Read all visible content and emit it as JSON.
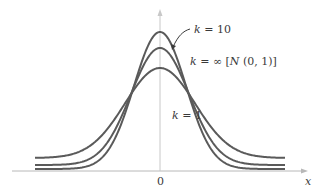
{
  "chart_data": {
    "type": "line",
    "title": "",
    "xlabel": "x",
    "ylabel": "",
    "x_ticks": [
      "0"
    ],
    "grid": false,
    "legend": "inline annotations",
    "series": [
      {
        "name": "k = 10",
        "peak_height_px": 139,
        "tail_height_px": 2,
        "description": "Student t-like density with k=10; taller peak than standard normal? (drawn highest)"
      },
      {
        "name": "k = ∞ [N (0, 1)]",
        "peak_height_px": 123,
        "tail_height_px": 6
      },
      {
        "name": "k = 1",
        "peak_height_px": 103,
        "tail_height_px": 13
      }
    ],
    "annotations": [
      {
        "text": "k = 10",
        "arrow_to": "top curve"
      },
      {
        "text": "k = ∞ [N (0, 1)]"
      },
      {
        "text": "k = 1"
      }
    ]
  },
  "labels": {
    "k10_k": "k",
    "k10_rest": " = 10",
    "kinf_k": "k",
    "kinf_rest": " = ∞ [",
    "kinf_N": "N",
    "kinf_tail": " (0, 1)]",
    "k1_k": "k",
    "k1_rest": " = 1",
    "origin": "0",
    "xaxis": "x"
  },
  "colors": {
    "curve": "#5a5a5a",
    "axis": "#b8b8b8",
    "text": "#3a3a3a"
  }
}
